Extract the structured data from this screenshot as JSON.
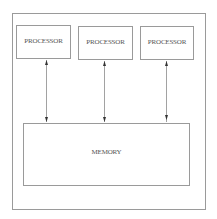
{
  "diagram": {
    "processors": [
      {
        "label": "PROCESSOR"
      },
      {
        "label": "PROCESSOR"
      },
      {
        "label": "PROCESSOR"
      }
    ],
    "memory": {
      "label": "MEMORY"
    },
    "connections": [
      {
        "from": "processor-1",
        "to": "memory",
        "type": "bidirectional"
      },
      {
        "from": "processor-2",
        "to": "memory",
        "type": "bidirectional"
      },
      {
        "from": "processor-3",
        "to": "memory",
        "type": "bidirectional"
      }
    ],
    "line_color": "#9a9a9a",
    "arrow_color": "#333333"
  }
}
